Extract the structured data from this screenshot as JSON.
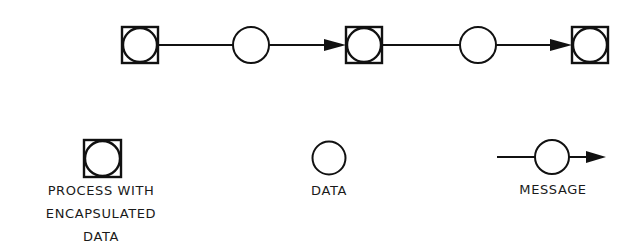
{
  "diagram": {
    "type": "flow",
    "stroke_color": "#111111",
    "background": "#ffffff",
    "nodes": [
      {
        "id": "p1",
        "kind": "process",
        "x": 122,
        "y": 27,
        "size": 36
      },
      {
        "id": "d1",
        "kind": "data",
        "cx": 251,
        "cy": 45,
        "r": 18
      },
      {
        "id": "p2",
        "kind": "process",
        "x": 346,
        "y": 27,
        "size": 36
      },
      {
        "id": "d2",
        "kind": "data",
        "cx": 478,
        "cy": 45,
        "r": 18
      },
      {
        "id": "p3",
        "kind": "process",
        "x": 572,
        "y": 27,
        "size": 36
      }
    ],
    "edges": [
      {
        "from": "p1",
        "to": "d1",
        "arrow": false
      },
      {
        "from": "d1",
        "to": "p2",
        "arrow": true
      },
      {
        "from": "p2",
        "to": "d2",
        "arrow": false
      },
      {
        "from": "d2",
        "to": "p3",
        "arrow": true
      }
    ]
  },
  "legend": {
    "process": {
      "lines": [
        "PROCESS WITH",
        "ENCAPSULATED",
        "DATA"
      ]
    },
    "data": {
      "label": "DATA"
    },
    "message": {
      "label": "MESSAGE"
    }
  }
}
